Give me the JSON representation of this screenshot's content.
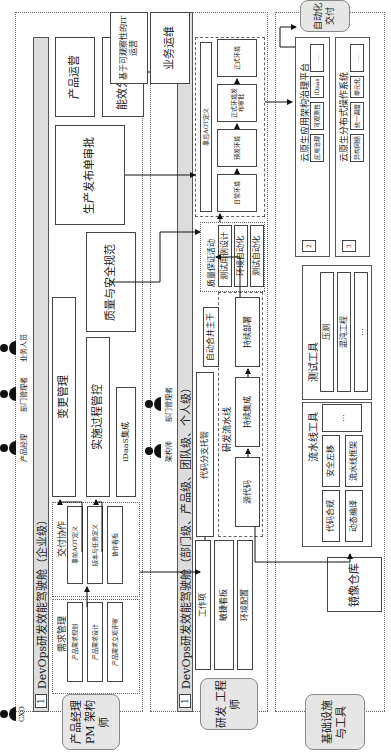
{
  "roles": {
    "product": "产品经理 PM 架构师",
    "dev": "研发 工程师",
    "infra": "基础设施 与工具",
    "auto_delivery": "自动化 交付"
  },
  "enterprise": {
    "band_num": "1",
    "band_title": "DevOps研发效能驾驶舱（企业级）",
    "personas": [
      "CXO",
      "产品经理",
      "部门管理者",
      "业务人员"
    ],
    "req_mgmt": {
      "title": "需求管理",
      "items": [
        "产品需求规划",
        "产品需求设计",
        "产品需求立项评审"
      ]
    },
    "delivery": {
      "title": "交付协作",
      "items": [
        "事前AOT定义",
        "版本与任务定义",
        "协作看板"
      ]
    },
    "change_mgmt": "变更管理",
    "impl_control": "实施过程管控",
    "idaas": "iDaaS集成",
    "quality_security": "质量与安全规范",
    "prod_release": "生产发布单审批",
    "product_ops": "产品运营",
    "efficiency_stats": "能效分析统计"
  },
  "department": {
    "band_num": "1",
    "band_title": "DevOps研发效能驾驶舱（部门级、产品级、团队级、个人级）",
    "personas": [
      "架构师",
      "部门管理者"
    ],
    "work_items": [
      "工作项",
      "敏捷看板",
      "环境配置"
    ],
    "code_branch": "代码分支托管",
    "pipeline": {
      "title": "研发流水线",
      "items": [
        "源代码",
        "持续集成",
        "持续部署"
      ]
    },
    "auto_merge": "自动合并主干",
    "qa": {
      "title": "质量保证活动",
      "items": [
        "测试用例设计",
        "环境自动化",
        "测试自动化"
      ]
    },
    "env": {
      "title": "事后AOT定义",
      "items": [
        "日常环境",
        "预发环境",
        "正式环境发布审批",
        "正式环境"
      ]
    },
    "biz_ops": "业务运维",
    "it_ops": "基于可观察性的IT运营"
  },
  "infra": {
    "image_repo": "镜像仓库",
    "pipeline_tools": {
      "title": "流水线工具",
      "items": [
        "代码合规",
        "安全左移",
        "动态编译",
        "流水线框架",
        "..."
      ]
    },
    "test_tools": {
      "title": "测试工具",
      "items": [
        "压测",
        "混沌工程",
        "..."
      ]
    },
    "cloud_arch": {
      "num": "2",
      "title": "云原生应用架构治理平台",
      "items": [
        "应用治理",
        "可观测性",
        "iDaas",
        "..."
      ]
    },
    "cloud_os": {
      "num": "3",
      "title": "云原生分布式操作系统",
      "items": [
        "异构网络",
        "统一调度",
        "单元化",
        "..."
      ]
    }
  }
}
